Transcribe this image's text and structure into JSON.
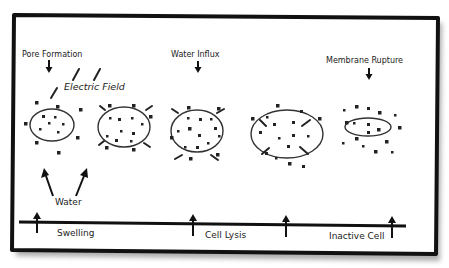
{
  "diagram": {
    "labels": {
      "pore_formation": "Pore Formation",
      "electric_field": "Electric Field",
      "water_influx": "Water Influx",
      "membrane_rupture": "Membrane Rupture",
      "water": "Water"
    },
    "timeline": {
      "stages": [
        {
          "label": "Swelling"
        },
        {
          "label": "Cell Lysis"
        },
        {
          "label": "Inactive Cell"
        }
      ]
    },
    "cells": [
      {
        "name": "intact-cell",
        "state": "pore formation"
      },
      {
        "name": "porated-cell",
        "state": "pores open"
      },
      {
        "name": "swelling-cell",
        "state": "water influx"
      },
      {
        "name": "lysing-cell",
        "state": "membrane stretching"
      },
      {
        "name": "ruptured-cell",
        "state": "membrane rupture"
      }
    ],
    "colors": {
      "frame": "#111111",
      "shadow": "#9a9a9a",
      "line": "#222222",
      "background": "#ffffff"
    }
  }
}
